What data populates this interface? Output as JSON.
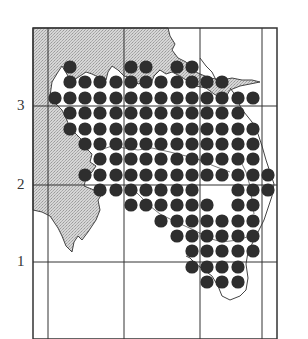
{
  "map": {
    "y_axis_labels": [
      {
        "label": "3",
        "y": 106
      },
      {
        "label": "2",
        "y": 185
      },
      {
        "label": "1",
        "y": 262
      }
    ],
    "colors": {
      "land_shaded": "#c8c8c8",
      "dots": "#2e2e2e",
      "grid": "#333333",
      "background": "#ffffff"
    },
    "dot_columns_x": [
      55,
      70,
      85,
      100,
      116,
      131,
      146,
      161,
      177,
      192,
      207,
      222,
      238,
      253,
      268
    ],
    "dot_rows": [
      {
        "y": 67,
        "cols": [
          1,
          5,
          6,
          8,
          9
        ]
      },
      {
        "y": 82,
        "cols": [
          1,
          2,
          3,
          4,
          5,
          6,
          7,
          8,
          9,
          10,
          11
        ]
      },
      {
        "y": 98,
        "cols": [
          0,
          1,
          2,
          3,
          4,
          5,
          6,
          7,
          8,
          9,
          10,
          11,
          12,
          13
        ]
      },
      {
        "y": 113,
        "cols": [
          1,
          2,
          3,
          4,
          5,
          6,
          7,
          8,
          9,
          10,
          11,
          12
        ]
      },
      {
        "y": 129,
        "cols": [
          1,
          2,
          3,
          4,
          5,
          6,
          7,
          8,
          9,
          10,
          11,
          12,
          13
        ]
      },
      {
        "y": 144,
        "cols": [
          2,
          3,
          4,
          5,
          6,
          7,
          8,
          9,
          10,
          11,
          12,
          13
        ]
      },
      {
        "y": 159,
        "cols": [
          3,
          4,
          5,
          6,
          7,
          8,
          9,
          10,
          11,
          12,
          13
        ]
      },
      {
        "y": 175,
        "cols": [
          2,
          3,
          4,
          5,
          6,
          7,
          8,
          9,
          10,
          11,
          12,
          13,
          14
        ]
      },
      {
        "y": 190,
        "cols": [
          3,
          4,
          5,
          6,
          7,
          8,
          9,
          12,
          13,
          14
        ]
      },
      {
        "y": 205,
        "cols": [
          5,
          6,
          7,
          8,
          9,
          10,
          12,
          13
        ]
      },
      {
        "y": 221,
        "cols": [
          7,
          8,
          9,
          10,
          11,
          12,
          13
        ]
      },
      {
        "y": 236,
        "cols": [
          8,
          9,
          10,
          11,
          12,
          13
        ]
      },
      {
        "y": 251,
        "cols": [
          9,
          10,
          11,
          12,
          13
        ]
      },
      {
        "y": 267,
        "cols": [
          9,
          10,
          11,
          12
        ]
      },
      {
        "y": 282,
        "cols": [
          10,
          11,
          12
        ]
      }
    ]
  }
}
